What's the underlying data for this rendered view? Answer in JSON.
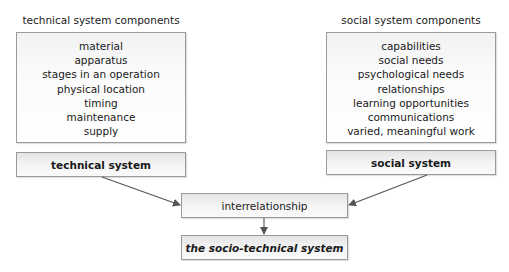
{
  "left": {
    "heading": "technical system components",
    "items": [
      "material",
      "apparatus",
      "stages in an operation",
      "physical location",
      "timing",
      "maintenance",
      "supply"
    ],
    "system_label": "technical system"
  },
  "right": {
    "heading": "social system components",
    "items": [
      "capabilities",
      "social needs",
      "psychological needs",
      "relationships",
      "learning opportunities",
      "communications",
      "varied, meaningful work"
    ],
    "system_label": "social system"
  },
  "center": {
    "interrelationship_label": "interrelationship",
    "result_label": "the socio-technical system"
  },
  "colors": {
    "border": "#9a9a9a",
    "arrow": "#555555",
    "text": "#1a1a1a"
  }
}
